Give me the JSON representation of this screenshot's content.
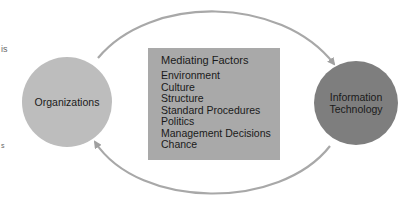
{
  "diagram": {
    "left_edge_fragments": [
      "is",
      "s"
    ],
    "nodes": {
      "organizations": {
        "label": "Organizations",
        "color": "#bdbdbd"
      },
      "information_technology": {
        "label": "Information Technology",
        "line1": "Information",
        "line2": "Technology",
        "color": "#7e7e7e"
      }
    },
    "mediating_factors": {
      "title": "Mediating Factors",
      "color": "#a9a9a9",
      "items": [
        "Environment",
        "Culture",
        "Structure",
        "Standard Procedures",
        "Politics",
        "Management Decisions",
        "Chance"
      ]
    },
    "edges": [
      {
        "from": "Organizations",
        "to": "Information Technology",
        "path": "top-arc"
      },
      {
        "from": "Information Technology",
        "to": "Organizations",
        "path": "bottom-arc"
      }
    ],
    "arrow_color": "#a0a0a0"
  }
}
